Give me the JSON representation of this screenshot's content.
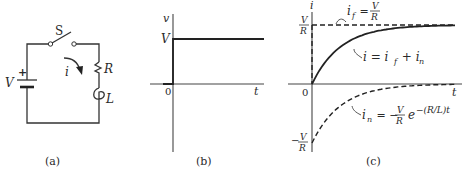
{
  "figure": {
    "panels": [
      {
        "id": "a",
        "caption": "(a)",
        "type": "circuit"
      },
      {
        "id": "b",
        "caption": "(b)",
        "type": "step-voltage-plot"
      },
      {
        "id": "c",
        "caption": "(c)",
        "type": "current-response-plot"
      }
    ]
  },
  "circuit": {
    "switch_label": "S",
    "source_label": "V",
    "source_polarity": "+",
    "current_label": "i",
    "resistor_label": "R",
    "inductor_label": "L",
    "caption": "(a)"
  },
  "plot_b": {
    "ylabel": "v",
    "xlabel": "t",
    "origin_label": "0",
    "level_label": "V",
    "caption": "(b)"
  },
  "plot_c": {
    "ylabel": "i",
    "xlabel": "t",
    "origin_label": "0",
    "pos_level": {
      "num": "V",
      "den": "R"
    },
    "neg_level": {
      "sign": "−",
      "num": "V",
      "den": "R"
    },
    "if_label": {
      "lhs": "i",
      "sub": "f",
      "eq": " = ",
      "num": "V",
      "den": "R"
    },
    "i_label": {
      "text1": "i = i",
      "sub1": "f",
      "text2": " + i",
      "sub2": "n"
    },
    "in_label": {
      "lhs": "i",
      "sub": "n",
      "eq": " = −",
      "num": "V",
      "den": "R",
      "e": "e",
      "exp": "−(R/L)t"
    },
    "caption": "(c)"
  },
  "chart_data": [
    {
      "type": "line",
      "title": "",
      "xlabel": "t",
      "ylabel": "v",
      "series": [
        {
          "name": "v(t)",
          "style": "solid",
          "x": [
            -0.5,
            0,
            0,
            5
          ],
          "y": [
            0,
            0,
            1,
            1
          ]
        }
      ],
      "y_ticks": [
        "0",
        "V"
      ],
      "xlim": [
        -0.5,
        5
      ],
      "ylim": [
        -1.3,
        1.4
      ]
    },
    {
      "type": "line",
      "title": "",
      "xlabel": "t",
      "ylabel": "i",
      "series": [
        {
          "name": "i_f = V/R",
          "style": "dashed",
          "x": [
            0,
            5
          ],
          "y": [
            1,
            1
          ]
        },
        {
          "name": "i = i_f + i_n",
          "style": "solid",
          "function": "1 - exp(-t)",
          "x": [
            0,
            0.5,
            1,
            1.5,
            2,
            3,
            4,
            5
          ],
          "y": [
            0,
            0.39,
            0.63,
            0.78,
            0.86,
            0.95,
            0.98,
            0.99
          ]
        },
        {
          "name": "i_n = -(V/R) e^{-(R/L)t}",
          "style": "dashed",
          "function": "-exp(-t)",
          "x": [
            0,
            0.5,
            1,
            1.5,
            2,
            3,
            4,
            5
          ],
          "y": [
            -1,
            -0.61,
            -0.37,
            -0.22,
            -0.14,
            -0.05,
            -0.02,
            -0.01
          ]
        }
      ],
      "y_ticks": [
        "-V/R",
        "0",
        "V/R"
      ],
      "units": {
        "y": "V/R",
        "x": "L/R"
      },
      "xlim": [
        -0.5,
        5
      ],
      "ylim": [
        -1.1,
        1.3
      ]
    }
  ]
}
